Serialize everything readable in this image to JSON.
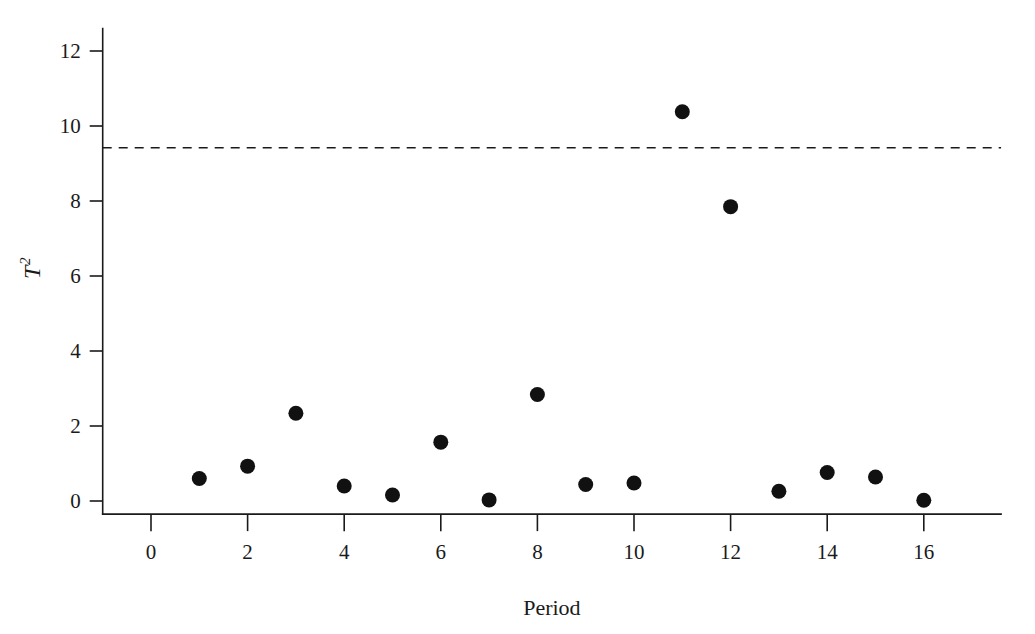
{
  "figure": {
    "name": "t-squared-control-chart",
    "background_color": "#ffffff",
    "ink_color": "#1a1a1a"
  },
  "chart_data": {
    "type": "scatter",
    "title": "",
    "xlabel": "Period",
    "ylabel": "T²",
    "ylabel_base": "T",
    "ylabel_exponent": "2",
    "xlim": [
      -1,
      17.6
    ],
    "ylim": [
      -0.35,
      12.6
    ],
    "xticks": [
      0,
      2,
      4,
      6,
      8,
      10,
      12,
      14,
      16
    ],
    "xtick_labels": [
      "0",
      "2",
      "4",
      "6",
      "8",
      "10",
      "12",
      "14",
      "16"
    ],
    "yticks": [
      0,
      2,
      4,
      6,
      8,
      10,
      12
    ],
    "ytick_labels": [
      "0",
      "2",
      "4",
      "6",
      "8",
      "10",
      "12"
    ],
    "grid": false,
    "legend": "none",
    "x": [
      1,
      2,
      3,
      4,
      5,
      6,
      7,
      8,
      9,
      10,
      11,
      12,
      13,
      14,
      15,
      16
    ],
    "y": [
      0.6,
      0.93,
      2.34,
      0.4,
      0.16,
      1.57,
      0.03,
      2.84,
      0.44,
      0.48,
      10.38,
      7.85,
      0.26,
      0.76,
      0.64,
      0.02
    ],
    "series": [
      {
        "name": "T2-statistic",
        "marker": "filled-circle",
        "marker_color": "#111111",
        "marker_size": 9,
        "values": [
          0.6,
          0.93,
          2.34,
          0.4,
          0.16,
          1.57,
          0.03,
          2.84,
          0.44,
          0.48,
          10.38,
          7.85,
          0.26,
          0.76,
          0.64,
          0.02
        ]
      }
    ],
    "annotations": [
      {
        "name": "upper-control-limit",
        "type": "horizontal-line",
        "value": 9.42,
        "style": "dashed",
        "color": "#1a1a1a",
        "label": ""
      }
    ],
    "points": [
      {
        "period": 1,
        "t2": 0.6
      },
      {
        "period": 2,
        "t2": 0.93
      },
      {
        "period": 3,
        "t2": 2.34
      },
      {
        "period": 4,
        "t2": 0.4
      },
      {
        "period": 5,
        "t2": 0.16
      },
      {
        "period": 6,
        "t2": 1.57
      },
      {
        "period": 7,
        "t2": 0.03
      },
      {
        "period": 8,
        "t2": 2.84
      },
      {
        "period": 9,
        "t2": 0.44
      },
      {
        "period": 10,
        "t2": 0.48
      },
      {
        "period": 11,
        "t2": 10.38
      },
      {
        "period": 12,
        "t2": 7.85
      },
      {
        "period": 13,
        "t2": 0.26
      },
      {
        "period": 14,
        "t2": 0.76
      },
      {
        "period": 15,
        "t2": 0.64
      },
      {
        "period": 16,
        "t2": 0.02
      }
    ]
  }
}
